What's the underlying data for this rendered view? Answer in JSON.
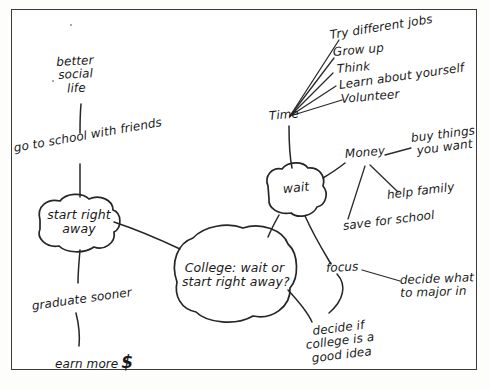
{
  "diagram": {
    "type": "hand-drawn mind map",
    "ink_color": "#262626",
    "paper_color": "#ffffff",
    "border_color": "#3a3a3a"
  },
  "center_node": {
    "label": "College: wait or\nstart right away?"
  },
  "left_branch": {
    "node": {
      "label": "start right\naway"
    },
    "items": [
      {
        "label": "better\nsocial\nlife"
      },
      {
        "label": "go to school with friends"
      },
      {
        "label": "graduate sooner"
      },
      {
        "label": "earn more",
        "suffix": "$"
      }
    ]
  },
  "right_branch": {
    "node": {
      "label": "wait"
    },
    "time": {
      "label": "Time",
      "items": [
        {
          "label": "Try different jobs"
        },
        {
          "label": "Grow up"
        },
        {
          "label": "Think"
        },
        {
          "label": "Learn about yourself"
        },
        {
          "label": "Volunteer"
        }
      ]
    },
    "money": {
      "label": "Money",
      "items": [
        {
          "label": "buy things\nyou want"
        },
        {
          "label": "help family"
        },
        {
          "label": "save for school"
        }
      ]
    },
    "focus": {
      "label": "focus",
      "items": [
        {
          "label": "decide what\nto major in"
        },
        {
          "label": "decide if\ncollege is a\ngood idea"
        }
      ]
    }
  }
}
